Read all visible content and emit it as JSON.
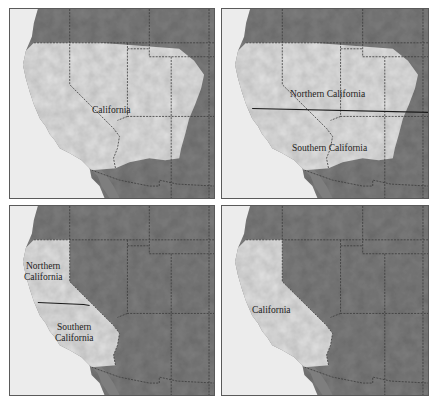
{
  "figure": {
    "layout": "2x2 grid of shaded-relief maps of the western United States",
    "colors": {
      "ocean": "#ececec",
      "highlight_region": "#e2e2e2",
      "other_land": "#7e7e7e",
      "state_border": "#3a3a3a",
      "divider_line": "#1a1a1a",
      "panel_border": "#5a5a5a"
    },
    "panels": [
      {
        "position": "top-left",
        "highlighted_region": "California, Nevada, Utah, Arizona and adjacent areas (enlarged)",
        "labels": [
          "California"
        ]
      },
      {
        "position": "top-right",
        "highlighted_region": "California, Nevada, Utah, Arizona and adjacent areas, split by a horizontal line",
        "labels": [
          "Northern California",
          "Southern California"
        ],
        "has_divider": true
      },
      {
        "position": "bottom-left",
        "highlighted_region": "State of California, split by a horizontal line",
        "labels": [
          "Northern",
          "California",
          "Southern",
          "California"
        ],
        "has_divider": true
      },
      {
        "position": "bottom-right",
        "highlighted_region": "State of California",
        "labels": [
          "California"
        ]
      }
    ]
  }
}
